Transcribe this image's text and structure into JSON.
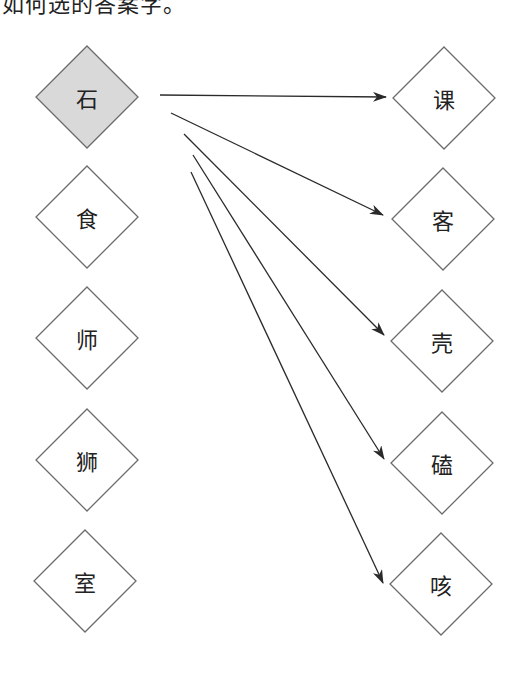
{
  "caption": {
    "text": "如何选的答案字。"
  },
  "colors": {
    "stroke": "#6b6b6b",
    "arrow": "#2a2a2a",
    "selected_fill": "#d9d9d9",
    "node_fill": "#ffffff"
  },
  "left_nodes": [
    {
      "label": "石",
      "selected": true
    },
    {
      "label": "食",
      "selected": false
    },
    {
      "label": "师",
      "selected": false
    },
    {
      "label": "狮",
      "selected": false
    },
    {
      "label": "室",
      "selected": false
    }
  ],
  "right_nodes": [
    {
      "label": "课"
    },
    {
      "label": "客"
    },
    {
      "label": "壳"
    },
    {
      "label": "磕"
    },
    {
      "label": "咳"
    }
  ],
  "arrows": [
    {
      "from": "石",
      "to": "课"
    },
    {
      "from": "石",
      "to": "客"
    },
    {
      "from": "石",
      "to": "壳"
    },
    {
      "from": "石",
      "to": "磕"
    },
    {
      "from": "石",
      "to": "咳"
    }
  ]
}
